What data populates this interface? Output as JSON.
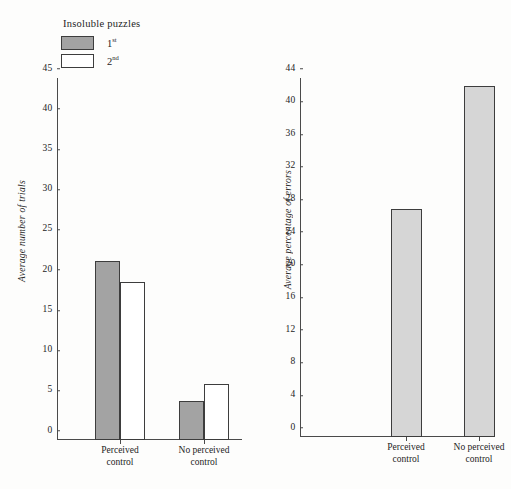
{
  "legend": {
    "title": "Insoluble puzzles",
    "entries": [
      {
        "label": "1",
        "sup": "st",
        "swatch": "fill-dark"
      },
      {
        "label": "2",
        "sup": "nd",
        "swatch": "fill-none"
      }
    ]
  },
  "chart_data": [
    {
      "type": "bar",
      "title": "",
      "xlabel": "",
      "ylabel": "Average number of trials",
      "ylim": [
        0,
        45
      ],
      "yticks": [
        0,
        5,
        10,
        15,
        20,
        25,
        30,
        35,
        40,
        45
      ],
      "grid": false,
      "legend_position": "top-left",
      "categories": [
        "Perceived\ncontrol",
        "No perceived\ncontrol"
      ],
      "series": [
        {
          "name": "1st",
          "values": [
            22.2,
            4.8
          ],
          "fill": "fill-dark"
        },
        {
          "name": "2nd",
          "values": [
            19.6,
            7.0
          ],
          "fill": "fill-none"
        }
      ]
    },
    {
      "type": "bar",
      "title": "",
      "xlabel": "",
      "ylabel": "Average percentage of errors",
      "ylim": [
        0,
        44
      ],
      "yticks": [
        0,
        4,
        8,
        12,
        16,
        20,
        24,
        28,
        32,
        36,
        40,
        44
      ],
      "grid": false,
      "legend_position": "none",
      "categories": [
        "Perceived\ncontrol",
        "No perceived\ncontrol"
      ],
      "series": [
        {
          "name": "errors",
          "values": [
            28.0,
            43.0
          ],
          "fill": "fill-light"
        }
      ]
    }
  ]
}
